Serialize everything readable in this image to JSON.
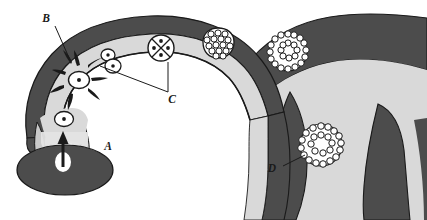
{
  "figure": {
    "background_color": "#ffffff",
    "palette": {
      "dark_tissue": "#4c4c4c",
      "light_tissue": "#d9d9d9",
      "mid_tissue": "#c9c9c9",
      "outline": "#1a1a1a",
      "cell_fill": "#ffffff",
      "blood_meal": "#4c4c4c"
    }
  },
  "labels": [
    {
      "id": "A",
      "text": "A",
      "x": 118,
      "y": 148,
      "meaning": "blood-meal / ookinete entry point",
      "has_leader": false
    },
    {
      "id": "B",
      "text": "B",
      "x": 46,
      "y": 20,
      "meaning": "midgut epithelium penetration",
      "has_leader": true
    },
    {
      "id": "C",
      "text": "C",
      "x": 170,
      "y": 98,
      "meaning": "developing oocyst stages",
      "has_leader": true
    },
    {
      "id": "D",
      "text": "D",
      "x": 271,
      "y": 170,
      "meaning": "sporozoites in salivary gland",
      "has_leader": true
    }
  ],
  "stages": [
    {
      "name": "ookinete-in-lumen",
      "kind": "single-nucleus-cell",
      "cx": 64,
      "cy": 119,
      "rx": 9,
      "ry": 7,
      "nucleus_r": 1.8
    },
    {
      "name": "penetrating-ookinete",
      "kind": "single-nucleus-cell-with-rays",
      "cx": 78,
      "cy": 80,
      "rx": 10,
      "ry": 8,
      "nucleus_r": 1.9,
      "rays": 8
    },
    {
      "name": "binucleate-oocyst",
      "kind": "double-cell",
      "cx": 110,
      "cy": 61,
      "rx": 7.5,
      "ry": 6.5,
      "nucleus_r": 1.7
    },
    {
      "name": "four-nuclei-oocyst",
      "kind": "quadrant-cell",
      "cx": 161,
      "cy": 48,
      "r": 13,
      "nuclei": 4
    },
    {
      "name": "multinucleate-oocyst",
      "kind": "cluster-cell",
      "cx": 218,
      "cy": 44,
      "r": 16,
      "granules": 19
    },
    {
      "name": "mature-oocyst-rosette",
      "kind": "ring-cell",
      "cx": 288,
      "cy": 52,
      "r": 19,
      "granules": 30
    },
    {
      "name": "salivary-gland-sporozoites",
      "kind": "ring-cell",
      "cx": 321,
      "cy": 145,
      "r": 21,
      "granules": 30
    }
  ],
  "arrow": {
    "name": "ookinete-entry-arrow",
    "x": 63,
    "y_from": 165,
    "y_to": 134
  },
  "blood_meal": {
    "name": "blood-meal-mass",
    "cx": 65,
    "cy": 170,
    "rx": 48,
    "ry": 25
  }
}
